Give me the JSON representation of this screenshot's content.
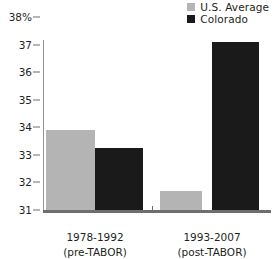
{
  "chart_data": {
    "type": "bar",
    "title": "",
    "subtitle": "",
    "xlabel": "",
    "ylabel": "",
    "ylim": [
      31,
      38
    ],
    "yticks": [
      31,
      32,
      33,
      34,
      35,
      36,
      37,
      38
    ],
    "ytick_labels": [
      "31",
      "32",
      "33",
      "34",
      "35",
      "36",
      "37",
      "38%"
    ],
    "grid": false,
    "legend_position": "top-right",
    "categories": [
      "1978-1992 (pre-TABOR)",
      "1993-2007 (post-TABOR)"
    ],
    "category_lines": [
      {
        "line1": "1978-1992",
        "line2": "(pre-TABOR)"
      },
      {
        "line1": "1993-2007",
        "line2": "(post-TABOR)"
      }
    ],
    "series": [
      {
        "name": "U.S. Average",
        "color": "#b4b4b4",
        "values": [
          33.9,
          31.7
        ]
      },
      {
        "name": "Colorado",
        "color": "#1a1a1a",
        "values": [
          33.25,
          37.1
        ]
      }
    ]
  },
  "legend": {
    "items": [
      {
        "label": "U.S. Average",
        "color": "#b4b4b4"
      },
      {
        "label": "Colorado",
        "color": "#1a1a1a"
      }
    ]
  },
  "axis": {
    "baseline_color": "#6d6e71",
    "tick_color": "#6d6e71",
    "axis_line_color": "#939598"
  }
}
